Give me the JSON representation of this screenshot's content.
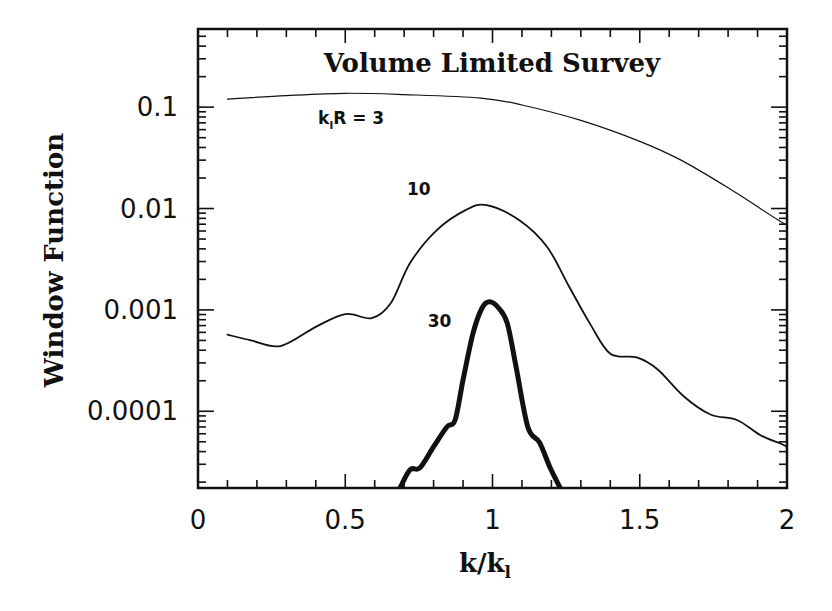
{
  "chart_data": {
    "type": "line",
    "title": "Volume Limited Survey",
    "xlabel": "k/k_l",
    "ylabel": "Window Function",
    "xscale": "linear",
    "yscale": "log",
    "xlim": [
      0,
      2
    ],
    "ylim": [
      1.75e-05,
      0.59
    ],
    "grid": false,
    "legend": "inline curve labels",
    "x_ticks": [
      0,
      0.5,
      1,
      1.5,
      2
    ],
    "x_tick_labels": [
      "0",
      "0.5",
      "1",
      "1.5",
      "2"
    ],
    "y_ticks": [
      0.1,
      0.01,
      0.001,
      0.0001
    ],
    "y_tick_labels": [
      "0.1",
      "0.01",
      "0.001",
      "0.0001"
    ],
    "series": [
      {
        "name": "k_lR = 3",
        "label_main": "k",
        "label_sub": "l",
        "label_rest": "R = 3",
        "label_pos": [
          0.52,
          0.068
        ],
        "stroke_width": 1.2,
        "x": [
          0.1,
          0.3,
          0.5,
          0.7,
          0.96,
          1.1,
          1.3,
          1.5,
          1.64,
          1.8,
          1.97,
          2.0
        ],
        "y": [
          0.12,
          0.13,
          0.137,
          0.133,
          0.123,
          0.105,
          0.074,
          0.046,
          0.03,
          0.016,
          0.0077,
          0.0069
        ]
      },
      {
        "name": "k_lR = 10",
        "label_main": "10",
        "label_pos": [
          0.75,
          0.0135
        ],
        "stroke_width": 1.8,
        "x": [
          0.1,
          0.18,
          0.28,
          0.4,
          0.5,
          0.59,
          0.655,
          0.72,
          0.81,
          0.91,
          0.98,
          1.09,
          1.185,
          1.26,
          1.33,
          1.4,
          1.49,
          1.56,
          1.65,
          1.74,
          1.83,
          1.91,
          1.985,
          2.0
        ],
        "y": [
          0.00057,
          0.0005,
          0.00044,
          0.00068,
          0.00091,
          0.00083,
          0.00117,
          0.0029,
          0.0061,
          0.0097,
          0.0108,
          0.0077,
          0.0042,
          0.0017,
          0.00074,
          0.00037,
          0.00034,
          0.00026,
          0.00014,
          9.3e-05,
          8.2e-05,
          5.8e-05,
          4.7e-05,
          4.4e-05
        ]
      },
      {
        "name": "k_lR = 30",
        "label_main": "30",
        "label_pos": [
          0.82,
          0.00068
        ],
        "stroke_width": 5,
        "x": [
          0.686,
          0.72,
          0.754,
          0.8,
          0.845,
          0.873,
          0.9,
          0.934,
          0.965,
          0.99,
          1.02,
          1.05,
          1.08,
          1.12,
          1.16,
          1.195,
          1.23
        ],
        "y": [
          1.75e-05,
          2.65e-05,
          2.77e-05,
          4.47e-05,
          7e-05,
          8.2e-05,
          0.000204,
          0.00059,
          0.00105,
          0.0012,
          0.00105,
          0.00074,
          0.000275,
          7e-05,
          4.9e-05,
          2.8e-05,
          1.75e-05
        ]
      }
    ]
  },
  "colors": {
    "ink": "#111111",
    "background": "#ffffff"
  }
}
